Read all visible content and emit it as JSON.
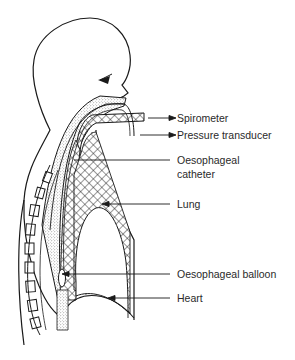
{
  "diagram": {
    "type": "anatomical-schematic",
    "colors": {
      "line": "#1a1a1a",
      "background": "#ffffff",
      "stipple": "#555555",
      "text": "#2a2a2a"
    },
    "labels": [
      {
        "id": "spirometer",
        "text": "Spirometer",
        "arrow": "outward"
      },
      {
        "id": "pressure-transducer",
        "text": "Pressure transducer",
        "arrow": "outward"
      },
      {
        "id": "oesophageal-catheter-line1",
        "text": "Oesophageal",
        "arrow": "none"
      },
      {
        "id": "oesophageal-catheter-line2",
        "text": "catheter",
        "arrow": "none"
      },
      {
        "id": "lung",
        "text": "Lung",
        "arrow": "inward"
      },
      {
        "id": "oesophageal-balloon",
        "text": "Oesophageal balloon",
        "arrow": "inward"
      },
      {
        "id": "heart",
        "text": "Heart",
        "arrow": "inward"
      }
    ]
  }
}
